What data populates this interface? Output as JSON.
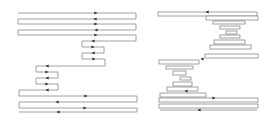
{
  "figure": {
    "panels": [
      {
        "id": "left",
        "description": "serpentine toolpath with nested sub-loops",
        "stroke_color": "#8a8a8a",
        "arrow_color": "#333333",
        "path_points": [
          [
            18,
            13
          ],
          [
            136,
            13
          ],
          [
            136,
            19
          ],
          [
            18,
            19
          ],
          [
            18,
            24
          ],
          [
            136,
            24
          ],
          [
            136,
            30
          ],
          [
            18,
            30
          ],
          [
            18,
            35
          ],
          [
            136,
            35
          ],
          [
            136,
            41
          ],
          [
            82,
            41
          ],
          [
            82,
            47
          ],
          [
            104,
            47
          ],
          [
            104,
            53
          ],
          [
            82,
            53
          ],
          [
            82,
            59
          ],
          [
            105,
            59
          ],
          [
            105,
            66
          ],
          [
            36,
            66
          ],
          [
            36,
            72
          ],
          [
            58,
            72
          ],
          [
            58,
            78
          ],
          [
            36,
            78
          ],
          [
            36,
            84
          ],
          [
            58,
            84
          ],
          [
            58,
            90
          ],
          [
            19,
            90
          ],
          [
            19,
            96
          ],
          [
            137,
            96
          ],
          [
            137,
            102
          ],
          [
            19,
            102
          ],
          [
            19,
            108
          ],
          [
            137,
            108
          ],
          [
            137,
            112
          ],
          [
            19,
            112
          ]
        ],
        "arrows": [
          {
            "x": 96,
            "y": 13,
            "dir": "right"
          },
          {
            "x": 95,
            "y": 19,
            "dir": "left"
          },
          {
            "x": 96,
            "y": 24,
            "dir": "right"
          },
          {
            "x": 96,
            "y": 30,
            "dir": "left"
          },
          {
            "x": 96,
            "y": 35,
            "dir": "right"
          },
          {
            "x": 93,
            "y": 41,
            "dir": "left"
          },
          {
            "x": 93,
            "y": 47,
            "dir": "right"
          },
          {
            "x": 93,
            "y": 53,
            "dir": "left"
          },
          {
            "x": 94,
            "y": 59,
            "dir": "right"
          },
          {
            "x": 47,
            "y": 66,
            "dir": "left"
          },
          {
            "x": 47,
            "y": 72,
            "dir": "right"
          },
          {
            "x": 47,
            "y": 78,
            "dir": "left"
          },
          {
            "x": 47,
            "y": 84,
            "dir": "right"
          },
          {
            "x": 47,
            "y": 90,
            "dir": "left"
          },
          {
            "x": 86,
            "y": 96,
            "dir": "right"
          },
          {
            "x": 57,
            "y": 102,
            "dir": "left"
          },
          {
            "x": 85,
            "y": 108,
            "dir": "right"
          },
          {
            "x": 58,
            "y": 112,
            "dir": "left"
          }
        ]
      },
      {
        "id": "right",
        "description": "stacked contour-offset rectangles forming two opposing wedges",
        "stroke_color": "#8a8a8a",
        "arrow_color": "#333333",
        "boxes": [
          {
            "x": 158,
            "y": 12,
            "w": 99,
            "h": 4
          },
          {
            "x": 206,
            "y": 16,
            "w": 52,
            "h": 4
          },
          {
            "x": 213,
            "y": 21,
            "w": 32,
            "h": 3
          },
          {
            "x": 220,
            "y": 26,
            "w": 20,
            "h": 3
          },
          {
            "x": 226,
            "y": 31,
            "w": 11,
            "h": 3
          },
          {
            "x": 220,
            "y": 35,
            "w": 20,
            "h": 3
          },
          {
            "x": 214,
            "y": 40,
            "w": 31,
            "h": 4
          },
          {
            "x": 210,
            "y": 45,
            "w": 41,
            "h": 4
          },
          {
            "x": 205,
            "y": 54,
            "w": 53,
            "h": 4
          },
          {
            "x": 159,
            "y": 60,
            "w": 40,
            "h": 4
          },
          {
            "x": 166,
            "y": 66,
            "w": 27,
            "h": 3
          },
          {
            "x": 173,
            "y": 71,
            "w": 13,
            "h": 4
          },
          {
            "x": 180,
            "y": 77,
            "w": 11,
            "h": 3
          },
          {
            "x": 173,
            "y": 82,
            "w": 19,
            "h": 4
          },
          {
            "x": 167,
            "y": 87,
            "w": 31,
            "h": 4
          },
          {
            "x": 160,
            "y": 93,
            "w": 46,
            "h": 4
          },
          {
            "x": 159,
            "y": 98,
            "w": 99,
            "h": 4
          },
          {
            "x": 159,
            "y": 104,
            "w": 99,
            "h": 4
          }
        ],
        "lines": [
          {
            "x1": 160,
            "y1": 110,
            "x2": 257,
            "y2": 110
          }
        ],
        "arrows": [
          {
            "x": 207,
            "y": 12,
            "dir": "left"
          },
          {
            "x": 202,
            "y": 59,
            "dir": "left"
          },
          {
            "x": 186,
            "y": 91,
            "dir": "left"
          },
          {
            "x": 214,
            "y": 98,
            "dir": "right"
          },
          {
            "x": 199,
            "y": 110,
            "dir": "left"
          }
        ]
      }
    ]
  }
}
